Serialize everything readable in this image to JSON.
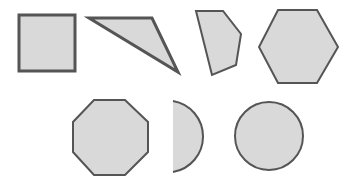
{
  "diagram": {
    "width": 359,
    "height": 180,
    "background": "#ffffff",
    "fill_color": "#d9d9d9",
    "stroke_color": "#555555",
    "shapes": [
      {
        "name": "square",
        "type": "polygon",
        "points": "19,15 75,15 75,71 19,71",
        "stroke_width": 3
      },
      {
        "name": "triangle",
        "type": "polygon",
        "points": "89,18 152,18 178,72",
        "stroke_width": 3
      },
      {
        "name": "pentagon",
        "type": "polygon",
        "points": "196,11 223,11 241,34 236,65 212,75",
        "stroke_width": 2
      },
      {
        "name": "hexagon",
        "type": "polygon",
        "points": "278,10 317,10 338,47 317,83 278,83 259,47",
        "stroke_width": 2
      },
      {
        "name": "octagon",
        "type": "polygon",
        "points": "94,100 125,100 148,122 148,152 125,175 94,175 73,152 73,122",
        "stroke_width": 2
      },
      {
        "name": "half-circle",
        "type": "path",
        "d": "M173,101 A36,36 0 0 1 173,172 Z",
        "arc_only": "M173,101 A36,36 0 0 1 173,172",
        "stroke_width": 2
      },
      {
        "name": "circle",
        "type": "circle",
        "cx": 269,
        "cy": 136,
        "r": 34,
        "stroke_width": 2
      }
    ]
  }
}
